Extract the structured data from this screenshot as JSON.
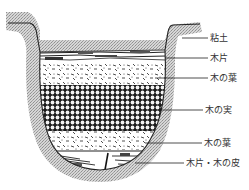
{
  "diagram": {
    "type": "cross-section",
    "layers": [
      {
        "id": "clay",
        "label": "粘土",
        "label_y": 37,
        "line_x1": 185,
        "line_y": 37
      },
      {
        "id": "wood-chips-top",
        "label": "木片",
        "label_y": 57,
        "line_x1": 170,
        "line_y": 57
      },
      {
        "id": "leaves-upper",
        "label": "木の葉",
        "label_y": 77,
        "line_x1": 155,
        "line_y": 77
      },
      {
        "id": "nuts",
        "label": "木の実",
        "label_y": 110,
        "line_x1": 160,
        "line_y": 110
      },
      {
        "id": "leaves-lower",
        "label": "木の葉",
        "label_y": 143,
        "line_x1": 150,
        "line_y": 143
      },
      {
        "id": "wood-chips-bark",
        "label": "木片・木の皮",
        "label_y": 163,
        "line_x1": 140,
        "line_y": 163
      }
    ],
    "colors": {
      "clay_fill": "#bdbdbd",
      "outline": "#222222",
      "text": "#333333",
      "background": "#ffffff"
    }
  }
}
